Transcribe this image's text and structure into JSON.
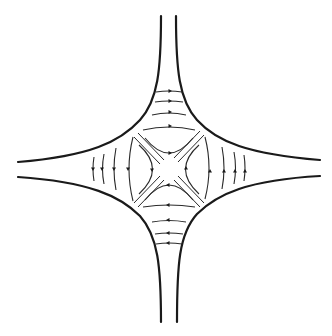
{
  "diagram": {
    "type": "cross-junction streamline flow",
    "colors": {
      "background": "#ffffff",
      "wall": "#1a1a1a",
      "streamline": "#2a2a2a"
    },
    "arms": [
      {
        "name": "top",
        "arrow_direction": "right",
        "streamline_count": 4
      },
      {
        "name": "left",
        "arrow_direction": "down",
        "streamline_count": 4
      },
      {
        "name": "bottom",
        "arrow_direction": "left",
        "streamline_count": 4
      },
      {
        "name": "right",
        "arrow_direction": "up",
        "streamline_count": 4
      }
    ],
    "center": {
      "hyperbolic_streamlines": 4,
      "separatrices": "two diagonal double-lines connecting opposite corners"
    }
  }
}
